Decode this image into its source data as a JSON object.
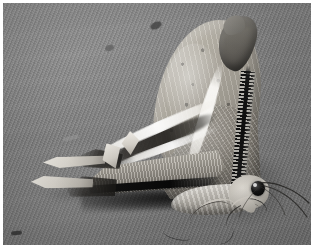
{
  "image": {
    "domain": "Natural-Image",
    "title": "Moth resting on gray fabric",
    "subject": "moth",
    "view": "lateral profile, facing right",
    "width_px": 314,
    "height_px": 248,
    "border": {
      "style": "white photographic frame",
      "color": "#ffffff",
      "thickness_px": 3
    },
    "palette": {
      "background_gray": "#858585",
      "background_light": "#8f8f8f",
      "background_dark": "#787878",
      "wing_pale": "#c9c5bb",
      "wing_mid": "#a8a399",
      "wing_dark": "#6a6760",
      "wing_hook_dark": "#5f5c56",
      "white_band": "#fbfaf7",
      "margin_black": "#0e0e0e",
      "shadow_black": "#000000",
      "eye_black": "#141414"
    },
    "background": {
      "name": "woven gray fabric",
      "texture": "fine diagonal weave, upper-left to lower-right",
      "lighting": "soft, light falling from upper left",
      "debris": [
        {
          "name": "dark speck upper-left",
          "x_px": 102,
          "y_px": 42
        },
        {
          "name": "dark speck upper-center",
          "x_px": 147,
          "y_px": 19
        },
        {
          "name": "dark fleck lower-left corner",
          "x_px": 8,
          "y_px": 228
        },
        {
          "name": "pale lint streak left",
          "x_px": 60,
          "y_px": 133
        },
        {
          "name": "thin curved hair lower-center",
          "x_px": 160,
          "y_px": 226
        },
        {
          "name": "thin curved hair lower-right",
          "x_px": 212,
          "y_px": 224
        }
      ]
    },
    "subject_parts": [
      {
        "name": "forewing",
        "description": "large pale tan wing held upright, speckled with small dark dots, curved leading edge",
        "tone": "pale tan to mid gray"
      },
      {
        "name": "wing-apex-hook",
        "description": "darker gray hooked wing tip curling backward at top",
        "tone": "dark gray"
      },
      {
        "name": "white-leading-streak",
        "description": "bright white streak along forewing trailing edge",
        "tone": "white"
      },
      {
        "name": "hindwing",
        "description": "broad triangular lower wing with fine vein striations",
        "tone": "mid gray tan"
      },
      {
        "name": "wing-margin-fringe",
        "description": "black comb-like serrated wing margin along right edge",
        "tone": "black"
      },
      {
        "name": "white-diagonal-band",
        "description": "bright white diagonal band crossing the wing midsection",
        "tone": "white"
      },
      {
        "name": "dark-median-band",
        "description": "dark brown-gray band running parallel beneath the white band",
        "tone": "dark gray brown"
      },
      {
        "name": "lower-wing-plank",
        "description": "long flattened pale wing extending left with dark lower edge",
        "tone": "pale with dark edge"
      },
      {
        "name": "tail-projections",
        "description": "two pale pointed tail lobes projecting to the left",
        "tone": "near white"
      },
      {
        "name": "abdomen",
        "description": "pale segmented abdomen below the wings",
        "tone": "off white"
      },
      {
        "name": "thorax",
        "description": "rounded pale thorax behind the head",
        "tone": "pale gray"
      },
      {
        "name": "head",
        "description": "small pale head at the right",
        "tone": "pale gray"
      },
      {
        "name": "eye",
        "description": "large round black compound eye",
        "tone": "black"
      },
      {
        "name": "antennae",
        "description": "two long thin antennae sweeping right and downward",
        "count": 2
      },
      {
        "name": "legs",
        "description": "slender legs extending down and to the left from the thorax",
        "count": 3
      },
      {
        "name": "cast-shadow",
        "description": "dark shadow cast beneath the body onto the fabric",
        "tone": "black"
      }
    ]
  }
}
